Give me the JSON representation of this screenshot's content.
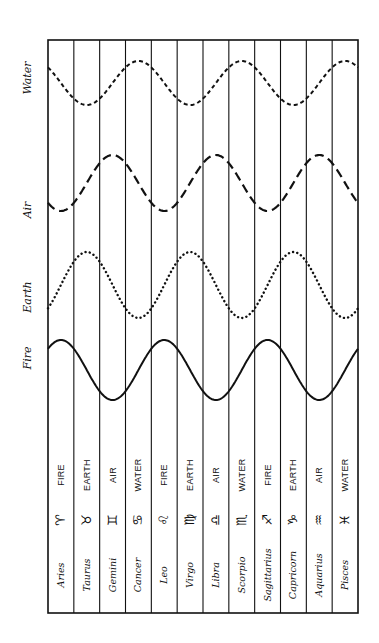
{
  "diagram": {
    "title": "",
    "frame": {
      "left": 48,
      "right": 358,
      "top": 40,
      "bottom": 613,
      "stroke": "#111111"
    },
    "waves_region": {
      "left": 48,
      "right": 358
    },
    "element_waves": [
      {
        "name": "Water",
        "label": "Water",
        "style": "short-dash",
        "center_y": 83,
        "amplitude": 22,
        "peak_signs": [
          "Cancer",
          "Scorpio",
          "Pisces"
        ],
        "label_y": 78
      },
      {
        "name": "Air",
        "label": "Air",
        "style": "long-dash",
        "center_y": 183,
        "amplitude": 28,
        "peak_signs": [
          "Gemini",
          "Libra",
          "Aquarius"
        ],
        "label_y": 210
      },
      {
        "name": "Earth",
        "label": "Earth",
        "style": "dotted",
        "center_y": 285,
        "amplitude": 33,
        "peak_signs": [
          "Taurus",
          "Virgo",
          "Capricorn"
        ],
        "label_y": 297
      },
      {
        "name": "Fire",
        "label": "Fire",
        "style": "solid",
        "center_y": 370,
        "amplitude": 30,
        "peak_signs": [
          "Aries",
          "Leo",
          "Sagittarius"
        ],
        "label_y": 358
      }
    ],
    "signs": [
      {
        "name": "Aries",
        "glyph": "♈",
        "element": "FIRE"
      },
      {
        "name": "Taurus",
        "glyph": "♉",
        "element": "EARTH"
      },
      {
        "name": "Gemini",
        "glyph": "♊",
        "element": "AIR"
      },
      {
        "name": "Cancer",
        "glyph": "♋",
        "element": "WATER"
      },
      {
        "name": "Leo",
        "glyph": "♌",
        "element": "FIRE"
      },
      {
        "name": "Virgo",
        "glyph": "♍",
        "element": "EARTH"
      },
      {
        "name": "Libra",
        "glyph": "♎",
        "element": "AIR"
      },
      {
        "name": "Scorpio",
        "glyph": "♏",
        "element": "WATER"
      },
      {
        "name": "Sagittarius",
        "glyph": "♐",
        "element": "FIRE"
      },
      {
        "name": "Capricorn",
        "glyph": "♑",
        "element": "EARTH"
      },
      {
        "name": "Aquarius",
        "glyph": "♒",
        "element": "AIR"
      },
      {
        "name": "Pisces",
        "glyph": "♓",
        "element": "WATER"
      }
    ],
    "rows": {
      "element_text_y": 475,
      "glyph_y": 520,
      "name_text_y": 575
    }
  }
}
